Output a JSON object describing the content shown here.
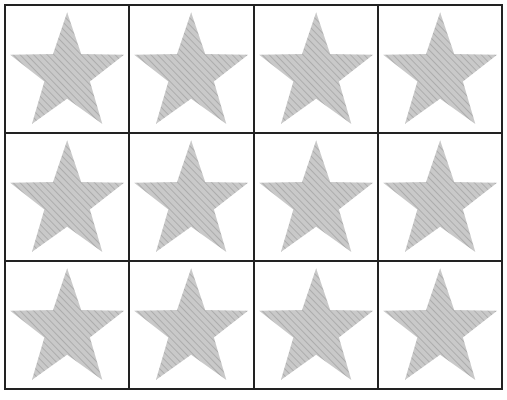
{
  "worksheet": {
    "rows": 3,
    "columns": 4,
    "shape": "star-icon",
    "fill_color": "#c9c9c9",
    "stripe_color": "#a5a5a5",
    "border_color": "#222222",
    "cells": [
      {
        "shape": "star"
      },
      {
        "shape": "star"
      },
      {
        "shape": "star"
      },
      {
        "shape": "star"
      },
      {
        "shape": "star"
      },
      {
        "shape": "star"
      },
      {
        "shape": "star"
      },
      {
        "shape": "star"
      },
      {
        "shape": "star"
      },
      {
        "shape": "star"
      },
      {
        "shape": "star"
      },
      {
        "shape": "star"
      }
    ]
  }
}
